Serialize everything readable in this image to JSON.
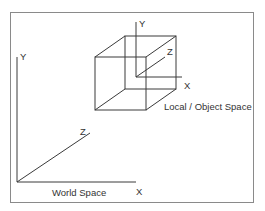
{
  "diagram": {
    "world": {
      "label": "World Space",
      "axes": {
        "x": "X",
        "y": "Y",
        "z": "Z"
      }
    },
    "local": {
      "label": "Local / Object Space",
      "axes": {
        "x": "X",
        "y": "Y",
        "z": "Z"
      }
    },
    "colors": {
      "line": "#3a3a3a",
      "frame": "#8a8a8a",
      "text": "#333333",
      "background": "#ffffff"
    }
  }
}
